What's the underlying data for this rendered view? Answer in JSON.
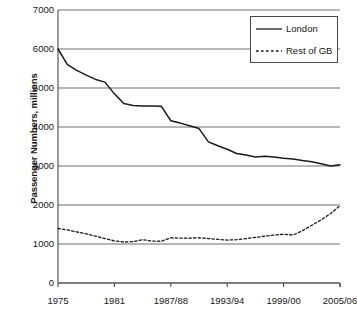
{
  "chart_data": {
    "type": "line",
    "title": "",
    "xlabel": "",
    "ylabel": "Passenger Numbers, millions",
    "ylim": [
      0,
      7000
    ],
    "ytick_values": [
      0,
      1000,
      2000,
      3000,
      4000,
      5000,
      6000,
      7000
    ],
    "ytick_labels": [
      "0",
      "1000",
      "2000",
      "3000",
      "4000",
      "5000",
      "6000",
      "7000"
    ],
    "grid": "horizontal",
    "legend_position": "top-right",
    "x": [
      "1975",
      "1976",
      "1977",
      "1978",
      "1979",
      "1980",
      "1981",
      "1982",
      "1983",
      "1984",
      "1985",
      "1986",
      "1987/88",
      "1988/89",
      "1989/90",
      "1990/91",
      "1991/92",
      "1992/93",
      "1993/94",
      "1994/95",
      "1995/96",
      "1996/97",
      "1997/98",
      "1998/99",
      "1999/00",
      "2000/01",
      "2001/02",
      "2002/03",
      "2003/04",
      "2004/05",
      "2005/06"
    ],
    "xtick_labels": [
      "1975",
      "1981",
      "1987/88",
      "1993/94",
      "1999/00",
      "2005/06"
    ],
    "xtick_positions": [
      "1975",
      "1981",
      "1987/88",
      "1993/94",
      "1999/00",
      "2005/06"
    ],
    "series": [
      {
        "name": "London",
        "style": "solid",
        "color": "#1a1a1a",
        "values": [
          6000,
          5600,
          5450,
          5330,
          5220,
          5150,
          4850,
          4600,
          4550,
          4540,
          4540,
          4530,
          4160,
          4100,
          4030,
          3960,
          3620,
          3520,
          3430,
          3320,
          3280,
          3230,
          3250,
          3230,
          3200,
          3180,
          3140,
          3110,
          3060,
          3000,
          3030
        ]
      },
      {
        "name": "Rest of GB",
        "style": "dashed",
        "color": "#1a1a1a",
        "values": [
          1400,
          1360,
          1310,
          1260,
          1200,
          1140,
          1080,
          1050,
          1060,
          1110,
          1075,
          1070,
          1160,
          1150,
          1150,
          1160,
          1140,
          1120,
          1100,
          1110,
          1140,
          1170,
          1200,
          1230,
          1250,
          1230,
          1340,
          1480,
          1620,
          1780,
          1980
        ]
      }
    ]
  },
  "legend": {
    "entries": [
      {
        "label": "London",
        "style": "solid"
      },
      {
        "label": "Rest of GB",
        "style": "dashed"
      }
    ]
  },
  "axis": {
    "y_title": "Passenger Numbers, millions"
  }
}
